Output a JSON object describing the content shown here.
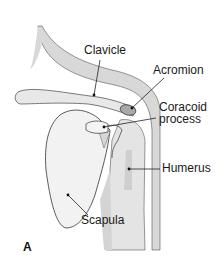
{
  "figure": {
    "panel_letter": "A",
    "labels": {
      "clavicle": "Clavicle",
      "acromion": "Acromion",
      "coracoid_line1": "Coracoid",
      "coracoid_line2": "process",
      "humerus": "Humerus",
      "scapula": "Scapula"
    },
    "colors": {
      "bone_gray": "#d6d6d6",
      "outline": "#333333",
      "acromion_fill": "#a9a9a9",
      "background": "#ffffff"
    }
  }
}
